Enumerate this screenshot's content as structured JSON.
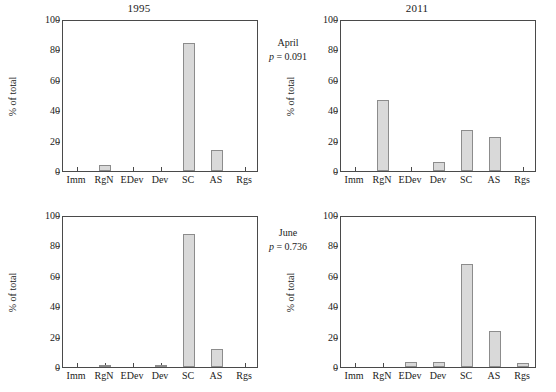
{
  "figure": {
    "ylabel": "% of total",
    "categories": [
      "Imm",
      "RgN",
      "EDev",
      "Dev",
      "SC",
      "AS",
      "Rgs"
    ],
    "yticks": [
      "0",
      "20",
      "40",
      "60",
      "80",
      "100"
    ],
    "ylim": [
      0,
      100
    ],
    "bar_fill": "#d9d9d9",
    "bar_stroke": "#8c8c8c",
    "axis_color": "#4a4a4a"
  },
  "annotations": [
    {
      "month": "April",
      "pvalue": "p = 0.091"
    },
    {
      "month": "June",
      "pvalue": "p = 0.736"
    }
  ],
  "chart_data": [
    {
      "type": "bar",
      "title": "1995",
      "panel": "top-left",
      "month": "April",
      "categories": [
        "Imm",
        "RgN",
        "EDev",
        "Dev",
        "SC",
        "AS",
        "Rgs"
      ],
      "values": [
        0,
        4,
        0,
        0,
        84,
        14,
        0
      ],
      "xlabel": "",
      "ylabel": "% of total",
      "ylim": [
        0,
        100
      ],
      "yticks": [
        0,
        20,
        40,
        60,
        80,
        100
      ],
      "grid": false,
      "legend": "none"
    },
    {
      "type": "bar",
      "title": "2011",
      "panel": "top-right",
      "month": "April",
      "categories": [
        "Imm",
        "RgN",
        "EDev",
        "Dev",
        "SC",
        "AS",
        "Rgs"
      ],
      "values": [
        0,
        47,
        0,
        6,
        27,
        22.5,
        0
      ],
      "xlabel": "",
      "ylabel": "% of total",
      "ylim": [
        0,
        100
      ],
      "yticks": [
        0,
        20,
        40,
        60,
        80,
        100
      ],
      "grid": false,
      "legend": "none"
    },
    {
      "type": "bar",
      "title": "",
      "panel": "bottom-left",
      "month": "June",
      "categories": [
        "Imm",
        "RgN",
        "EDev",
        "Dev",
        "SC",
        "AS",
        "Rgs"
      ],
      "values": [
        0,
        1,
        0,
        1.5,
        87.5,
        12,
        0
      ],
      "xlabel": "",
      "ylabel": "% of total",
      "ylim": [
        0,
        100
      ],
      "yticks": [
        0,
        20,
        40,
        60,
        80,
        100
      ],
      "grid": false,
      "legend": "none"
    },
    {
      "type": "bar",
      "title": "",
      "panel": "bottom-right",
      "month": "June",
      "categories": [
        "Imm",
        "RgN",
        "EDev",
        "Dev",
        "SC",
        "AS",
        "Rgs"
      ],
      "values": [
        0,
        0,
        3,
        3,
        68,
        24,
        2.5
      ],
      "xlabel": "",
      "ylabel": "% of total",
      "ylim": [
        0,
        100
      ],
      "yticks": [
        0,
        20,
        40,
        60,
        80,
        100
      ],
      "grid": false,
      "legend": "none"
    }
  ]
}
